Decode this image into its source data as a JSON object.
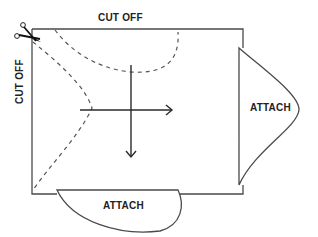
{
  "diagram": {
    "type": "pattern-piece-instruction",
    "labels": {
      "top": "CUT OFF",
      "left": "CUT OFF",
      "right_flap": "ATTACH",
      "bottom_flap": "ATTACH"
    },
    "icons": {
      "scissors": "scissors-icon",
      "horizontal_arrow": "arrow-right-icon",
      "vertical_arrow": "arrow-down-icon"
    },
    "colors": {
      "line": "#4a4a4a",
      "text": "#222222",
      "background": "#ffffff"
    }
  }
}
